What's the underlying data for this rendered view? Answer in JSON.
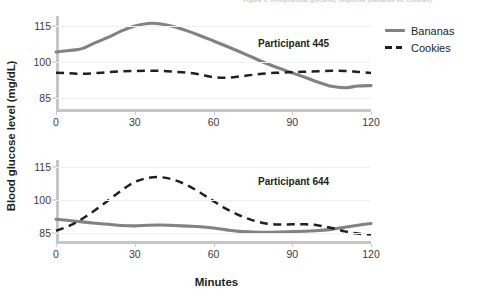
{
  "figure": {
    "cut_off_header": "Figure 2. Postprandial glycemic response (bananas vs. cookies)",
    "ylabel": "Blood glucose level (mg/dL)",
    "xlabel": "Minutes"
  },
  "legend": {
    "position": "right",
    "items": [
      {
        "label": "Bananas",
        "style": "solid",
        "color": "#808285"
      },
      {
        "label": "Cookies",
        "style": "dashed",
        "color": "#231f20"
      }
    ]
  },
  "panels": [
    {
      "id": "top",
      "annotation": "Participant 445",
      "yticks": [
        "115",
        "100",
        "85"
      ],
      "xticks": [
        "0",
        "30",
        "60",
        "90",
        "120"
      ]
    },
    {
      "id": "bottom",
      "annotation": "Participant 644",
      "yticks": [
        "115",
        "100",
        "85"
      ],
      "xticks": [
        "0",
        "30",
        "60",
        "90",
        "120"
      ]
    }
  ],
  "chart_data": [
    {
      "type": "line",
      "title": "Participant 445",
      "xlabel": "Minutes",
      "ylabel": "Blood glucose level (mg/dL)",
      "xlim": [
        0,
        120
      ],
      "ylim": [
        79,
        119
      ],
      "yticks": [
        85,
        100,
        115
      ],
      "xticks": [
        0,
        30,
        60,
        90,
        120
      ],
      "grid": true,
      "legend_position": "right",
      "x": [
        0,
        5,
        10,
        15,
        20,
        25,
        30,
        35,
        40,
        45,
        50,
        55,
        60,
        65,
        70,
        75,
        80,
        85,
        90,
        95,
        100,
        105,
        110,
        115,
        120
      ],
      "series": [
        {
          "name": "Bananas",
          "style": "solid",
          "color": "#808285",
          "values": [
            104.0,
            104.6,
            105.4,
            107.9,
            110.2,
            112.8,
            114.8,
            115.9,
            115.7,
            114.5,
            112.8,
            110.8,
            108.6,
            106.4,
            104.1,
            101.7,
            99.3,
            97.2,
            95.3,
            93.4,
            91.4,
            89.7,
            89.1,
            89.8,
            90.0
          ]
        },
        {
          "name": "Cookies",
          "style": "dashed",
          "color": "#231f20",
          "values": [
            95.4,
            95.2,
            94.9,
            95.2,
            95.6,
            95.9,
            96.1,
            96.2,
            96.1,
            95.8,
            95.4,
            94.6,
            93.5,
            93.3,
            93.8,
            94.5,
            95.1,
            95.4,
            95.6,
            95.8,
            96.0,
            96.2,
            96.1,
            95.7,
            95.3
          ]
        }
      ]
    },
    {
      "type": "line",
      "title": "Participant 644",
      "xlabel": "Minutes",
      "ylabel": "Blood glucose level (mg/dL)",
      "xlim": [
        0,
        120
      ],
      "ylim": [
        80,
        118
      ],
      "yticks": [
        85,
        100,
        115
      ],
      "xticks": [
        0,
        30,
        60,
        90,
        120
      ],
      "grid": true,
      "legend_position": "right",
      "x": [
        0,
        5,
        10,
        15,
        20,
        25,
        30,
        35,
        40,
        45,
        50,
        55,
        60,
        65,
        70,
        75,
        80,
        85,
        90,
        95,
        100,
        105,
        110,
        115,
        120
      ],
      "series": [
        {
          "name": "Bananas",
          "style": "solid",
          "color": "#808285",
          "values": [
            91.2,
            90.6,
            90.0,
            89.4,
            88.9,
            88.4,
            88.2,
            88.5,
            88.6,
            88.4,
            88.1,
            87.8,
            87.2,
            86.4,
            85.7,
            85.4,
            85.3,
            85.4,
            85.6,
            85.8,
            86.1,
            86.6,
            87.6,
            88.5,
            89.3
          ]
        },
        {
          "name": "Cookies",
          "style": "dashed",
          "color": "#231f20",
          "values": [
            86.0,
            88.2,
            91.4,
            95.4,
            99.8,
            104.3,
            108.0,
            109.9,
            110.2,
            109.0,
            106.6,
            103.2,
            99.4,
            95.8,
            92.9,
            90.7,
            89.3,
            88.8,
            88.9,
            88.9,
            88.4,
            87.2,
            85.7,
            84.7,
            84.3
          ]
        }
      ]
    }
  ]
}
